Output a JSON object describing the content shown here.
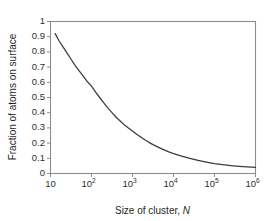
{
  "chart_data": {
    "type": "line",
    "title": "",
    "subtitle": "",
    "xlabel_prefix": "Size of cluster, ",
    "xlabel_symbol": "N",
    "ylabel": "Fraction of atoms on surface",
    "xscale": "log",
    "yscale": "linear",
    "xlim": [
      10,
      1000000
    ],
    "ylim": [
      0,
      1
    ],
    "grid": false,
    "legend": false,
    "legend_position": "none",
    "x_tick_labels": [
      "10",
      "10",
      "10",
      "10",
      "10",
      "10"
    ],
    "x_tick_exponents": [
      "",
      "2",
      "3",
      "4",
      "5",
      "6"
    ],
    "x_tick_values": [
      10,
      100,
      1000,
      10000,
      100000,
      1000000
    ],
    "y_tick_labels": [
      "0",
      "0.1",
      "0.2",
      "0.3",
      "0.4",
      "0.5",
      "0.6",
      "0.7",
      "0.8",
      "0.9",
      "1"
    ],
    "y_tick_values": [
      0,
      0.1,
      0.2,
      0.3,
      0.4,
      0.5,
      0.6,
      0.7,
      0.8,
      0.9,
      1
    ],
    "series": [
      {
        "name": "fraction of atoms on surface",
        "color": "#3b3b3b",
        "x": [
          13,
          16,
          20,
          25,
          32,
          40,
          50,
          63,
          79,
          100,
          126,
          158,
          200,
          251,
          316,
          398,
          501,
          631,
          794,
          1000,
          1259,
          1585,
          1995,
          2512,
          3162,
          3981,
          5012,
          6310,
          7943,
          10000,
          15849,
          25119,
          39811,
          63096,
          100000,
          158489,
          251189,
          398107,
          630957,
          1000000
        ],
        "y": [
          0.92,
          0.875,
          0.835,
          0.795,
          0.75,
          0.71,
          0.675,
          0.64,
          0.605,
          0.575,
          0.535,
          0.5,
          0.465,
          0.43,
          0.4,
          0.37,
          0.345,
          0.32,
          0.3,
          0.28,
          0.258,
          0.24,
          0.222,
          0.205,
          0.19,
          0.177,
          0.164,
          0.152,
          0.141,
          0.131,
          0.114,
          0.099,
          0.086,
          0.075,
          0.065,
          0.058,
          0.052,
          0.047,
          0.043,
          0.04
        ]
      }
    ]
  }
}
